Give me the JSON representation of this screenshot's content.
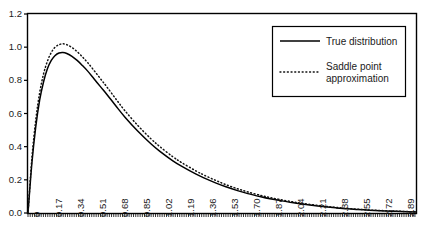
{
  "chart_data": {
    "type": "line",
    "title": "",
    "xlabel": "",
    "ylabel": "",
    "grid": false,
    "legend_position": "top-right",
    "xlim": [
      0,
      3.0
    ],
    "ylim": [
      0.0,
      1.2
    ],
    "y_ticks": [
      "0.0",
      "0.2",
      "0.4",
      "0.6",
      "0.8",
      "1.0",
      "1.2"
    ],
    "y_tick_values": [
      0.0,
      0.2,
      0.4,
      0.6,
      0.8,
      1.0,
      1.2
    ],
    "x_ticks": [
      "0",
      "0.17",
      "0.34",
      "0.51",
      "0.68",
      "0.85",
      "1.02",
      "1.19",
      "1.36",
      "1.53",
      "1.70",
      "1.87",
      "2.04",
      "2.21",
      "2.38",
      "2.55",
      "2.72",
      "2.89"
    ],
    "x_tick_values": [
      0,
      0.17,
      0.34,
      0.51,
      0.68,
      0.85,
      1.02,
      1.19,
      1.36,
      1.53,
      1.7,
      1.87,
      2.04,
      2.21,
      2.38,
      2.55,
      2.72,
      2.89
    ],
    "series": [
      {
        "name": "True distribution",
        "style": "solid",
        "color": "#000000",
        "x": [
          0.0,
          0.03,
          0.06,
          0.09,
          0.12,
          0.15,
          0.18,
          0.21,
          0.24,
          0.27,
          0.3,
          0.34,
          0.38,
          0.42,
          0.46,
          0.51,
          0.56,
          0.61,
          0.68,
          0.75,
          0.85,
          0.95,
          1.02,
          1.12,
          1.19,
          1.3,
          1.36,
          1.45,
          1.53,
          1.62,
          1.7,
          1.8,
          1.87,
          1.95,
          2.04,
          2.12,
          2.21,
          2.3,
          2.38,
          2.47,
          2.55,
          2.64,
          2.72,
          2.81,
          2.89,
          3.0
        ],
        "y": [
          0.0,
          0.3,
          0.52,
          0.68,
          0.79,
          0.87,
          0.92,
          0.95,
          0.965,
          0.968,
          0.962,
          0.945,
          0.92,
          0.89,
          0.857,
          0.81,
          0.762,
          0.715,
          0.645,
          0.578,
          0.493,
          0.418,
          0.372,
          0.315,
          0.281,
          0.234,
          0.212,
          0.182,
          0.158,
          0.135,
          0.117,
          0.098,
          0.086,
          0.075,
          0.063,
          0.054,
          0.045,
          0.037,
          0.031,
          0.025,
          0.021,
          0.017,
          0.014,
          0.011,
          0.009,
          0.006
        ]
      },
      {
        "name": "Saddle point approximation",
        "style": "dotted",
        "color": "#111111",
        "x": [
          0.0,
          0.03,
          0.06,
          0.09,
          0.12,
          0.15,
          0.18,
          0.21,
          0.24,
          0.27,
          0.3,
          0.34,
          0.38,
          0.42,
          0.46,
          0.51,
          0.56,
          0.61,
          0.68,
          0.75,
          0.85,
          0.95,
          1.02,
          1.12,
          1.19,
          1.3,
          1.36,
          1.45,
          1.53,
          1.62,
          1.7,
          1.8,
          1.87,
          1.95,
          2.04,
          2.12,
          2.21,
          2.3,
          2.38,
          2.47,
          2.55,
          2.64,
          2.72,
          2.81,
          2.89,
          3.0
        ],
        "y": [
          0.0,
          0.33,
          0.56,
          0.725,
          0.838,
          0.915,
          0.968,
          1.0,
          1.015,
          1.02,
          1.015,
          0.998,
          0.973,
          0.942,
          0.908,
          0.86,
          0.81,
          0.76,
          0.687,
          0.616,
          0.527,
          0.448,
          0.4,
          0.339,
          0.303,
          0.253,
          0.229,
          0.197,
          0.171,
          0.146,
          0.127,
          0.106,
          0.093,
          0.081,
          0.068,
          0.058,
          0.049,
          0.04,
          0.034,
          0.027,
          0.023,
          0.018,
          0.015,
          0.012,
          0.01,
          0.007
        ]
      }
    ]
  },
  "legend": {
    "items": [
      {
        "label": "True distribution",
        "label_line2": "",
        "style": "solid"
      },
      {
        "label": "Saddle point",
        "label_line2": "approximation",
        "style": "dotted"
      }
    ]
  },
  "colors": {
    "axis": "#000000",
    "true_distribution": "#000000",
    "saddle_point": "#111111",
    "background": "#ffffff"
  }
}
